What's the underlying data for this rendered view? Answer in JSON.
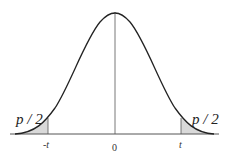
{
  "figure": {
    "type": "two-tailed t-distribution diagram",
    "curve": "bell-shaped density",
    "shaded_regions": [
      "left tail beyond -t",
      "right tail beyond t"
    ],
    "tail_labels": {
      "left": "p / 2",
      "right": "p / 2"
    },
    "axis_ticks": {
      "left": "-t",
      "center": "0",
      "right": "t"
    },
    "colors": {
      "curve": "#222222",
      "shade": "#d8d8d8",
      "axis": "#555555"
    }
  }
}
